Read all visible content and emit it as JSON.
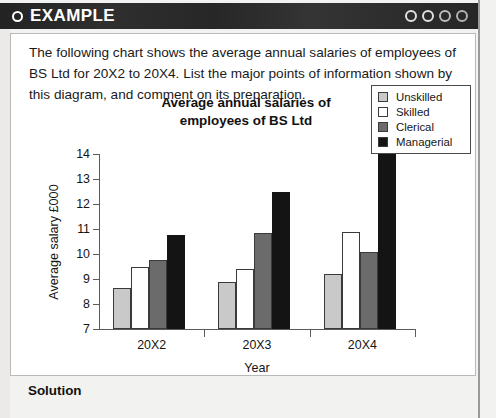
{
  "header": {
    "title": "EXAMPLE",
    "bullet_icon": "ring-icon",
    "dots": [
      "circle-icon",
      "circle-icon",
      "circle-icon",
      "circle-icon"
    ]
  },
  "intro": {
    "text": "The following chart shows the average annual salaries of employees of BS Ltd for 20X2 to 20X4.  List the major points of information shown by this diagram, and comment on its preparation."
  },
  "solution": {
    "label": "Solution"
  },
  "chart_data": {
    "type": "bar",
    "title": "Average annual salaries of employees of BS Ltd",
    "title_line1": "Average annual salaries of",
    "title_line2": "employees of BS Ltd",
    "xlabel": "Year",
    "ylabel": "Average salary £000",
    "categories": [
      "20X2",
      "20X3",
      "20X4"
    ],
    "ylim": [
      7,
      14
    ],
    "yticks": [
      7,
      8,
      9,
      10,
      11,
      12,
      13,
      14
    ],
    "grid": false,
    "legend_position": "top-right",
    "series": [
      {
        "name": "Unskilled",
        "color": "#c9c9c9",
        "values": [
          8.65,
          8.9,
          9.2
        ]
      },
      {
        "name": "Skilled",
        "color": "#ffffff",
        "values": [
          9.5,
          9.4,
          10.9
        ]
      },
      {
        "name": "Clerical",
        "color": "#6b6b6b",
        "values": [
          9.75,
          10.85,
          10.1
        ]
      },
      {
        "name": "Managerial",
        "color": "#141414",
        "values": [
          10.75,
          12.5,
          14.0
        ]
      }
    ]
  }
}
